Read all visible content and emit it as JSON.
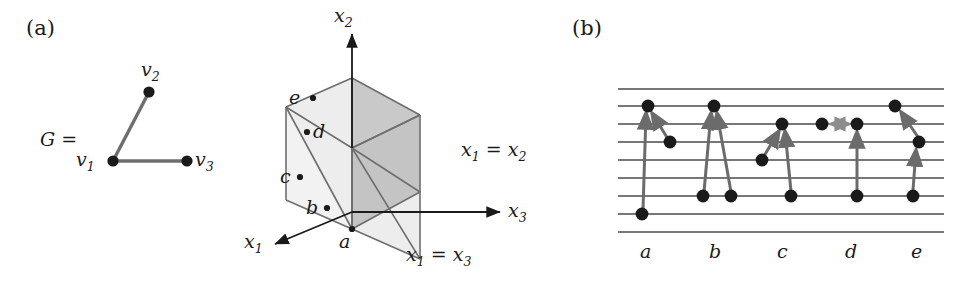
{
  "figure": {
    "panels": [
      {
        "id": "a",
        "label": "(a)"
      },
      {
        "id": "b",
        "label": "(b)"
      }
    ]
  },
  "graph": {
    "name": "G =",
    "vertices": [
      {
        "id": "v1",
        "label": "v",
        "sub": "1",
        "x": 113,
        "y": 161
      },
      {
        "id": "v2",
        "label": "v",
        "sub": "2",
        "x": 149,
        "y": 92
      },
      {
        "id": "v3",
        "label": "v",
        "sub": "3",
        "x": 187,
        "y": 161
      }
    ],
    "edges": [
      {
        "from": "v1",
        "to": "v2"
      },
      {
        "from": "v1",
        "to": "v3"
      }
    ],
    "vertex_labels": [
      {
        "text": "v",
        "sub": "2",
        "x": 141,
        "y": 61
      },
      {
        "text": "v",
        "sub": "1",
        "x": 76,
        "y": 148
      },
      {
        "text": "v",
        "sub": "3",
        "x": 195,
        "y": 148
      }
    ]
  },
  "cube": {
    "axes": [
      {
        "name": "x2",
        "label": "x",
        "sub": "2",
        "x": 333,
        "y": 4
      },
      {
        "name": "x3",
        "label": "x",
        "sub": "3",
        "x": 510,
        "y": 200
      },
      {
        "name": "x1",
        "label": "x",
        "sub": "1",
        "x": 248,
        "y": 232
      }
    ],
    "plane_labels": [
      {
        "name": "x1=x2",
        "lhs": "x",
        "lhs_sub": "1",
        "eq": " = ",
        "rhs": "x",
        "rhs_sub": "2",
        "x": 462,
        "y": 140
      },
      {
        "name": "x1=x3",
        "lhs": "x",
        "lhs_sub": "1",
        "eq": " = ",
        "rhs": "x",
        "rhs_sub": "3",
        "x": 408,
        "y": 245
      }
    ],
    "points": [
      {
        "id": "a",
        "label": "a",
        "label_x": 345,
        "label_y": 240,
        "dot_x": 352,
        "dot_y": 229
      },
      {
        "id": "b",
        "label": "b",
        "label_x": 310,
        "label_y": 205,
        "dot_x": 327,
        "dot_y": 208
      },
      {
        "id": "c",
        "label": "c",
        "label_x": 284,
        "label_y": 174,
        "dot_x": 300,
        "dot_y": 177
      },
      {
        "id": "d",
        "label": "d",
        "label_x": 317,
        "label_y": 135,
        "dot_x": 307,
        "dot_y": 132
      },
      {
        "id": "e",
        "label": "e",
        "label_x": 288,
        "label_y": 102,
        "dot_x": 313,
        "dot_y": 98
      }
    ],
    "shading": {
      "dark": "#c9c9c9",
      "light": "#e8e8e8"
    }
  },
  "panel_b": {
    "column_labels": [
      "a",
      "b",
      "c",
      "d",
      "e"
    ],
    "staff_lines": 9,
    "arrow_color": "#6b6b6b",
    "line_color": "#4a4a4a",
    "columns": [
      {
        "name": "a",
        "dots": [
          {
            "x": 647,
            "line": 2
          },
          {
            "x": 668,
            "line": 4
          },
          {
            "x": 642,
            "line": 8
          }
        ],
        "arrows": [
          {
            "from": [
              642,
              8
            ],
            "to": [
              647,
              2
            ]
          },
          {
            "from": [
              668,
              4
            ],
            "to": [
              650,
              2
            ]
          }
        ]
      },
      {
        "name": "b",
        "dots": [
          {
            "x": 714,
            "line": 2
          },
          {
            "x": 703,
            "line": 7
          },
          {
            "x": 730,
            "line": 7
          }
        ],
        "arrows": [
          {
            "from": [
              703,
              7
            ],
            "to": [
              712,
              2
            ]
          },
          {
            "from": [
              730,
              7
            ],
            "to": [
              717,
              2
            ]
          }
        ]
      },
      {
        "name": "c",
        "dots": [
          {
            "x": 783,
            "line": 3
          },
          {
            "x": 762,
            "line": 5
          },
          {
            "x": 792,
            "line": 7
          }
        ],
        "arrows": [
          {
            "from": [
              762,
              5
            ],
            "to": [
              779,
              3
            ]
          },
          {
            "from": [
              792,
              7
            ],
            "to": [
              786,
              3
            ]
          }
        ]
      },
      {
        "name": "d",
        "dots": [
          {
            "x": 822,
            "line": 3
          },
          {
            "x": 857,
            "line": 3
          },
          {
            "x": 857,
            "line": 7
          }
        ],
        "arrows": [
          {
            "from": [
              857,
              7
            ],
            "to": [
              857,
              3
            ]
          }
        ],
        "bidirectional": [
          {
            "from": [
              829,
              3
            ],
            "to": [
              850,
              3
            ]
          }
        ]
      },
      {
        "name": "e",
        "dots": [
          {
            "x": 894,
            "line": 2
          },
          {
            "x": 919,
            "line": 4
          },
          {
            "x": 913,
            "line": 7
          }
        ],
        "arrows": [
          {
            "from": [
              919,
              4
            ],
            "to": [
              899,
              2
            ]
          },
          {
            "from": [
              913,
              7
            ],
            "to": [
              917,
              4
            ]
          }
        ]
      }
    ],
    "label_positions": [
      {
        "text": "a",
        "x": 643,
        "y": 252
      },
      {
        "text": "b",
        "x": 712,
        "y": 252
      },
      {
        "text": "c",
        "x": 780,
        "y": 252
      },
      {
        "text": "d",
        "x": 848,
        "y": 252
      },
      {
        "text": "e",
        "x": 914,
        "y": 252
      }
    ]
  },
  "colors": {
    "ink": "#1a1a1a",
    "line_gray": "#555555",
    "edge_gray": "#6e6e6e",
    "shade_dark": "#c9c9c9",
    "shade_light": "#e9e9e9"
  }
}
